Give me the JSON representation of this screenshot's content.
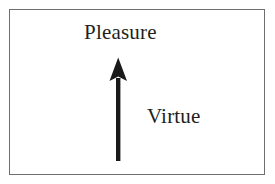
{
  "figure": {
    "type": "concept-diagram",
    "background_color": "#ffffff",
    "frame": {
      "present": true,
      "border_color": "#6f6f72",
      "border_width_px": 1,
      "fill": "#ffffff"
    },
    "labels": [
      {
        "id": "pleasure",
        "text": "Pleasure",
        "color": "#231f20",
        "font_style": "serif",
        "position": "top-center"
      },
      {
        "id": "virtue",
        "text": "Virtue",
        "color": "#231f20",
        "font_style": "serif",
        "position": "middle-right-of-arrow"
      }
    ],
    "arrow": {
      "id": "virtue-to-pleasure-arrow",
      "color": "#1a1a1a",
      "direction": "up",
      "meaning": "Virtue leads upward to Pleasure",
      "shaft_width_px": 4,
      "head_width_px": 17,
      "head_height_px": 22,
      "tip": {
        "x": 118,
        "y": 58
      },
      "tail": {
        "x": 118,
        "y": 161
      }
    }
  }
}
